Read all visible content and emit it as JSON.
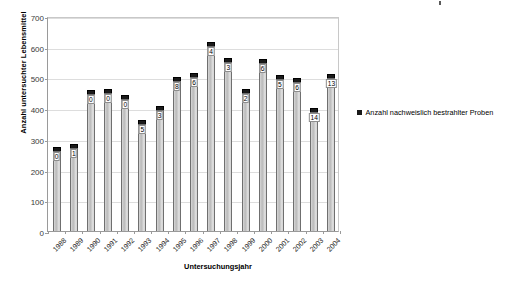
{
  "chart_data": {
    "type": "bar",
    "title": "",
    "subtitle": "",
    "xlabel": "Untersuchungsjahr",
    "ylabel": "Anzahl untersuchter Lebensmittel",
    "ylim": [
      0,
      700
    ],
    "ytick_labels": [
      "0",
      "100",
      "200",
      "300",
      "400",
      "500",
      "600",
      "700"
    ],
    "ytick_values": [
      0,
      100,
      200,
      300,
      400,
      500,
      600,
      700
    ],
    "grid": true,
    "legend_position": "right",
    "legend": [
      "Anzahl nachweislich bestrahlter Proben"
    ],
    "categories": [
      "1988",
      "1989",
      "1990",
      "1991",
      "1992",
      "1993",
      "1994",
      "1995",
      "1996",
      "1997",
      "1998",
      "1999",
      "2000",
      "2001",
      "2002",
      "2003",
      "2004"
    ],
    "series": [
      {
        "name": "Anzahl untersuchter Lebensmittel",
        "color": "#c8c8c8",
        "values": [
          275,
          282,
          458,
          463,
          443,
          362,
          408,
          500,
          515,
          615,
          562,
          463,
          560,
          508,
          498,
          400,
          510
        ]
      },
      {
        "name": "Anzahl nachweislich bestrahlter Proben",
        "color": "#1a1a1a",
        "values": [
          0,
          1,
          0,
          0,
          0,
          5,
          3,
          8,
          6,
          4,
          3,
          2,
          6,
          5,
          6,
          14,
          13
        ]
      }
    ],
    "data_labels": [
      "0",
      "1",
      "0",
      "0",
      "0",
      "5",
      "3",
      "8",
      "6",
      "4",
      "3",
      "2",
      "6",
      "5",
      "6",
      "14",
      "13"
    ]
  },
  "colors": {
    "bar_fill": "#c8c8c8",
    "bar_border": "#6f6f6f",
    "cap_fill": "#1a1a1a",
    "gridline": "#dddddd",
    "axis": "#9a9a9a",
    "text": "#000000",
    "background": "#ffffff"
  }
}
